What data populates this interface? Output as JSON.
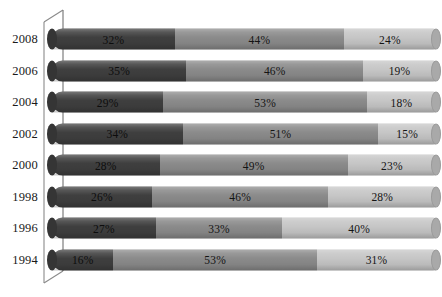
{
  "chart_data": {
    "type": "bar",
    "subtype": "stacked-horizontal-100-percent",
    "title": "",
    "xlabel": "",
    "ylabel": "",
    "xlim": [
      0,
      100
    ],
    "grid": false,
    "legend_position": "none",
    "orientation": "horizontal",
    "stacked": true,
    "units": "%",
    "categories": [
      "2008",
      "2006",
      "2004",
      "2002",
      "2000",
      "1998",
      "1996",
      "1994"
    ],
    "series": [
      {
        "name": "Series 1",
        "color": "#3f3f3f",
        "values": [
          32,
          35,
          29,
          34,
          28,
          26,
          27,
          16
        ],
        "labels": [
          "32%",
          "35%",
          "29%",
          "34%",
          "28%",
          "26%",
          "27%",
          "16%"
        ]
      },
      {
        "name": "Series 2",
        "color": "#8b8b8b",
        "values": [
          44,
          46,
          53,
          51,
          49,
          46,
          33,
          53
        ],
        "labels": [
          "44%",
          "46%",
          "53%",
          "51%",
          "49%",
          "46%",
          "33%",
          "53%"
        ]
      },
      {
        "name": "Series 3",
        "color": "#c6c6c6",
        "values": [
          24,
          19,
          18,
          15,
          23,
          28,
          40,
          31
        ],
        "labels": [
          "24%",
          "19%",
          "18%",
          "15%",
          "23%",
          "28%",
          "40%",
          "31%"
        ]
      }
    ]
  },
  "axis": {
    "frame_color": "#8a8a8a",
    "category_axis_line_color": "#7d7d7d"
  },
  "colors": {
    "segment_dark": "#3f3f3f",
    "segment_medium": "#8b8b8b",
    "segment_light": "#c6c6c6",
    "end_cap": "#a9a9a9",
    "background": "#ffffff",
    "label_text": "#141414"
  },
  "title_remnant": ""
}
